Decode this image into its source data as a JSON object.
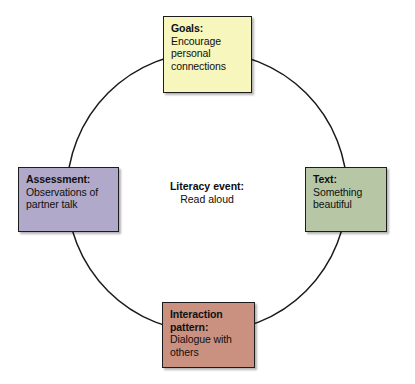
{
  "diagram": {
    "type": "cycle-diagram",
    "shape": "circle",
    "center": {
      "title": "Literacy event:",
      "body": "Read aloud"
    },
    "circle": {
      "cx": 207,
      "cy": 192,
      "r": 140,
      "stroke_color": "#1a1a1a"
    },
    "nodes": [
      {
        "id": "goals",
        "title": "Goals:",
        "body": "Encourage personal connections",
        "color": "#f6f6bd",
        "position": "top"
      },
      {
        "id": "text",
        "title": "Text:",
        "body": "Something beautiful",
        "color": "#b7c7a5",
        "position": "right"
      },
      {
        "id": "interaction",
        "title": "Interaction pattern:",
        "body": "Dialogue with others",
        "color": "#ca9180",
        "position": "bottom"
      },
      {
        "id": "assessment",
        "title": "Assessment:",
        "body": "Observations of partner talk",
        "color": "#b1a9c9",
        "position": "left"
      }
    ]
  }
}
